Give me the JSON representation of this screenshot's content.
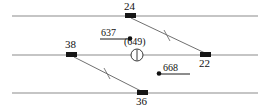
{
  "diagram": {
    "kind": "survey-parcel-diagram",
    "width": 271,
    "height": 112,
    "background_color": "#ffffff",
    "line_color": "#8c8c8c",
    "marker_color": "#161616",
    "text_color": "#111111",
    "boundary_lines": [
      {
        "name": "upper-boundary-line",
        "x1": 12,
        "y1": 16,
        "x2": 258,
        "y2": 16
      },
      {
        "name": "middle-boundary-line",
        "x1": 12,
        "y1": 55,
        "x2": 258,
        "y2": 55
      },
      {
        "name": "lower-boundary-line",
        "x1": 12,
        "y1": 93,
        "x2": 258,
        "y2": 93
      }
    ],
    "connector_lines": [
      {
        "name": "connector-24-22",
        "x1": 131,
        "y1": 18,
        "x2": 205,
        "y2": 53,
        "tick_at": 0.5
      },
      {
        "name": "connector-38-36",
        "x1": 74,
        "y1": 57,
        "x2": 141,
        "y2": 91,
        "tick_at": 0.5
      }
    ],
    "nodes": [
      {
        "id": "24",
        "label": "24",
        "x": 130,
        "y": 16,
        "label_pos": "above"
      },
      {
        "id": "38",
        "label": "38",
        "x": 71,
        "y": 55,
        "label_pos": "above"
      },
      {
        "id": "22",
        "label": "22",
        "x": 205,
        "y": 55,
        "label_pos": "below"
      },
      {
        "id": "36",
        "label": "36",
        "x": 142,
        "y": 93,
        "label_pos": "below"
      }
    ],
    "points": [
      {
        "id": "637",
        "label": "637",
        "dot_x": 130,
        "dot_y": 39,
        "dot_side": "right"
      },
      {
        "id": "668",
        "label": "668",
        "dot_x": 160,
        "dot_y": 74,
        "dot_side": "left"
      }
    ],
    "station": {
      "id": "649",
      "label": "(649)",
      "symbol": "circle-with-vertical-bar",
      "x": 137,
      "y": 55,
      "radius": 6,
      "label_x": 137,
      "label_y": 44
    }
  }
}
